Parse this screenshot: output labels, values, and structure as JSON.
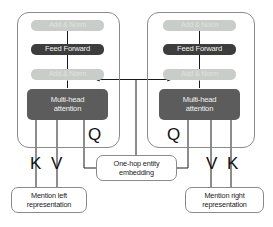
{
  "diagram": {
    "colors": {
      "panel_border": "#8a8a8a",
      "add_norm_fill": "#c9cdc9",
      "add_norm_text": "#dfe2df",
      "feed_forward_fill": "#3d3d3d",
      "multi_head_fill": "#5c5c5c",
      "block_text": "#f2f2f2",
      "note_border": "#8a8a8a",
      "note_text": "#1a1a1a",
      "arrow": "#1a1a1a",
      "background": "#ffffff"
    },
    "left_encoder": {
      "add_norm_top": "Add & Norm",
      "feed_forward": "Feed Forward",
      "add_norm_bottom": "Add & Norm",
      "multi_head_line1": "Multi-head",
      "multi_head_line2": "attention"
    },
    "right_encoder": {
      "add_norm_top": "Add & Norm",
      "feed_forward": "Feed Forward",
      "add_norm_bottom": "Add & Norm",
      "multi_head_line1": "Multi-head",
      "multi_head_line2": "attention"
    },
    "labels": {
      "left_k": "K",
      "left_v": "V",
      "left_q": "Q",
      "right_q": "Q",
      "right_v": "V",
      "right_k": "K"
    },
    "notes": {
      "mention_left_line1": "Mention left",
      "mention_left_line2": "representation",
      "one_hop_line1": "One-hop entity",
      "one_hop_line2": "embedding",
      "mention_right_line1": "Mention right",
      "mention_right_line2": "representation"
    }
  }
}
